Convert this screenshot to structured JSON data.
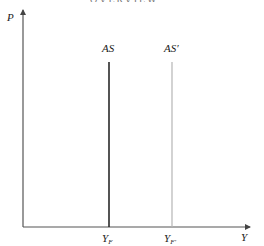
{
  "header": {
    "cut_off_title": "OVERVIEW"
  },
  "diagram": {
    "type": "aggregate-supply-shift",
    "axes": {
      "y_label": "P",
      "x_label": "Y"
    },
    "curves": [
      {
        "id": "as",
        "label": "AS",
        "x_tick_main": "Y",
        "x_tick_sub": "F",
        "color": "#2a2a2a"
      },
      {
        "id": "as_prime",
        "label": "AS′",
        "x_tick_main": "Y",
        "x_tick_sub": "F′",
        "color": "#b5b5b5"
      }
    ],
    "colors": {
      "axis": "#555555",
      "background": "#ffffff"
    }
  }
}
